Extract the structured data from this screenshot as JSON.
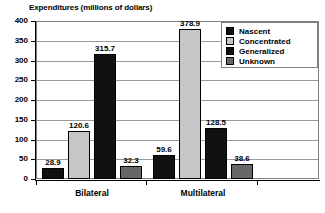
{
  "chart_data": {
    "type": "bar",
    "title": "Expenditures (millions of dollars)",
    "xlabel": "",
    "ylabel": "",
    "ylim": [
      0,
      400
    ],
    "ytick_values": [
      400,
      350,
      300,
      250,
      200,
      150,
      100,
      50,
      0
    ],
    "ytick_labels": [
      "400",
      "350",
      "300",
      "250",
      "200",
      "150",
      "100",
      "50",
      "0"
    ],
    "grid": true,
    "legend_position": "top-right",
    "categories": [
      "Bilateral",
      "Multilateral"
    ],
    "series": [
      {
        "name": "Nascent",
        "color": "#111111",
        "values": [
          28.9,
          59.6
        ],
        "labels": [
          "28.9",
          "59.6"
        ]
      },
      {
        "name": "Concentrated",
        "color": "#c6c6c6",
        "values": [
          120.6,
          378.9
        ],
        "labels": [
          "120.6",
          "378.9"
        ]
      },
      {
        "name": "Generalized",
        "color": "#111111",
        "values": [
          315.7,
          128.5
        ],
        "labels": [
          "315.7",
          "128.5"
        ]
      },
      {
        "name": "Unknown",
        "color": "#676767",
        "values": [
          32.3,
          38.6
        ],
        "labels": [
          "32.3",
          "38.6"
        ]
      }
    ]
  },
  "title": {
    "text": "Expenditures (millions of dollars)"
  },
  "yaxis": {
    "ticks": [
      {
        "label": "400"
      },
      {
        "label": "350"
      },
      {
        "label": "300"
      },
      {
        "label": "250"
      },
      {
        "label": "200"
      },
      {
        "label": "150"
      },
      {
        "label": "100"
      },
      {
        "label": "50"
      },
      {
        "label": "0"
      }
    ]
  },
  "xaxis": {
    "groups": [
      {
        "label": "Bilateral"
      },
      {
        "label": "Multilateral"
      }
    ]
  },
  "legend": {
    "items": [
      {
        "label": "Nascent"
      },
      {
        "label": "Concentrated"
      },
      {
        "label": "Generalized"
      },
      {
        "label": "Unknown"
      }
    ]
  },
  "bars": [
    {
      "value_label": "28.9"
    },
    {
      "value_label": "120.6"
    },
    {
      "value_label": "315.7"
    },
    {
      "value_label": "32.3"
    },
    {
      "value_label": "59.6"
    },
    {
      "value_label": "378.9"
    },
    {
      "value_label": "128.5"
    },
    {
      "value_label": "38.6"
    }
  ]
}
